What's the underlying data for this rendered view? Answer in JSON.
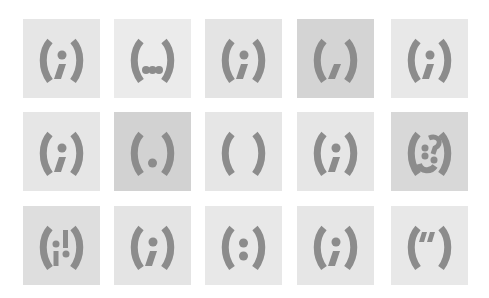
{
  "grid": {
    "columns": 5,
    "rows": 3,
    "glyph_color": "#8c8c8c",
    "tiles": [
      {
        "row": 0,
        "col": 0,
        "symbol": "(;)",
        "variant": "semicolon-i",
        "bg": "#e6e6e6"
      },
      {
        "row": 0,
        "col": 1,
        "symbol": "(...)",
        "variant": "ellipsis",
        "bg": "#ebebeb"
      },
      {
        "row": 0,
        "col": 2,
        "symbol": "(;)",
        "variant": "semicolon-i",
        "bg": "#e4e4e4"
      },
      {
        "row": 0,
        "col": 3,
        "symbol": "(,)",
        "variant": "comma",
        "bg": "#d4d4d4"
      },
      {
        "row": 0,
        "col": 4,
        "symbol": "(;)",
        "variant": "semicolon-i",
        "bg": "#e8e8e8"
      },
      {
        "row": 1,
        "col": 0,
        "symbol": "(;)",
        "variant": "semicolon-i",
        "bg": "#e6e6e6"
      },
      {
        "row": 1,
        "col": 1,
        "symbol": "(.)",
        "variant": "period",
        "bg": "#d2d2d2"
      },
      {
        "row": 1,
        "col": 2,
        "symbol": "( )",
        "variant": "empty",
        "bg": "#e6e6e6"
      },
      {
        "row": 1,
        "col": 3,
        "symbol": "(;)",
        "variant": "semicolon-i",
        "bg": "#e6e6e6"
      },
      {
        "row": 1,
        "col": 4,
        "symbol": "(?:)",
        "variant": "question-scramble",
        "bg": "#d8d8d8"
      },
      {
        "row": 2,
        "col": 0,
        "symbol": "(!;)",
        "variant": "exclaim-i",
        "bg": "#dedede"
      },
      {
        "row": 2,
        "col": 1,
        "symbol": "(;)",
        "variant": "semicolon-i",
        "bg": "#e4e4e4"
      },
      {
        "row": 2,
        "col": 2,
        "symbol": "(:)",
        "variant": "colon",
        "bg": "#e8e8e8"
      },
      {
        "row": 2,
        "col": 3,
        "symbol": "(;)",
        "variant": "semicolon-i",
        "bg": "#e6e6e6"
      },
      {
        "row": 2,
        "col": 4,
        "symbol": "(\")",
        "variant": "quote",
        "bg": "#e8e8e8"
      }
    ]
  }
}
